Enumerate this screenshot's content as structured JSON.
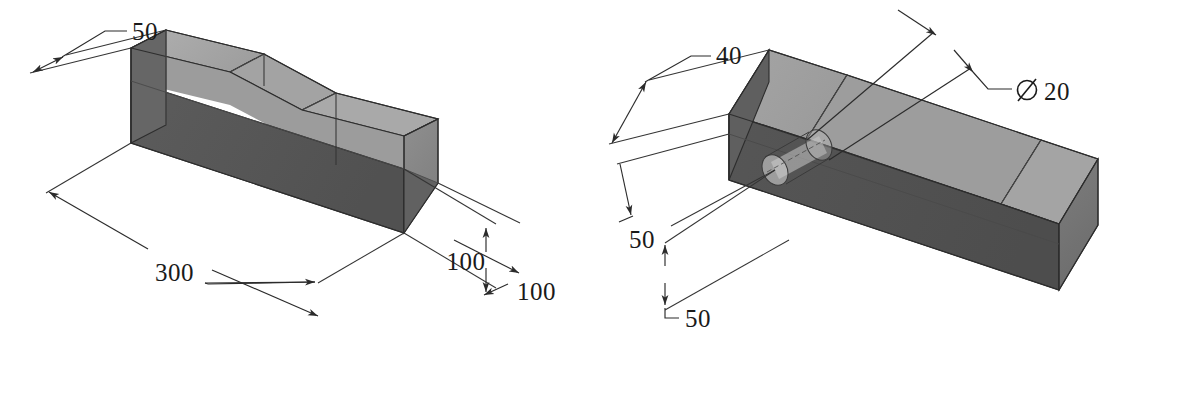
{
  "page": {
    "background_color": "#ffffff",
    "ink_color": "#2b2b2b",
    "figure_count": 2
  },
  "palette": {
    "face_top_light": "#a8a8a8",
    "face_front_dark": "#575757",
    "face_side_dark": "#6b6b6b",
    "face_end_mid": "#8d8d8d",
    "face_chamfer": "#9a9a9a",
    "hole_fill": "#d8d8d8",
    "line": "#2b2b2b"
  },
  "figures": [
    {
      "id": "left-block",
      "name": "isometric-block-without-hole",
      "description": "Isometric rectangular block with stepped chamfered top",
      "dimensions": [
        {
          "id": "width-50",
          "label": "50",
          "value": 50,
          "unit": "mm",
          "kind": "linear",
          "axis": "width"
        },
        {
          "id": "length-300",
          "label": "300",
          "value": 300,
          "unit": "mm",
          "kind": "linear",
          "axis": "length"
        },
        {
          "id": "height-100",
          "label": "100",
          "value": 100,
          "unit": "mm",
          "kind": "linear",
          "axis": "height"
        },
        {
          "id": "depth-100",
          "label": "100",
          "value": 100,
          "unit": "mm",
          "kind": "linear",
          "axis": "depth"
        }
      ]
    },
    {
      "id": "right-block",
      "name": "isometric-block-with-through-hole",
      "description": "Isometric rectangular block with chamfer and a cylindrical through hole",
      "dimensions": [
        {
          "id": "width-40",
          "label": "40",
          "value": 40,
          "unit": "mm",
          "kind": "linear",
          "axis": "width"
        },
        {
          "id": "offset-50-a",
          "label": "50",
          "value": 50,
          "unit": "mm",
          "kind": "linear",
          "axis": "offset"
        },
        {
          "id": "offset-50-b",
          "label": "50",
          "value": 50,
          "unit": "mm",
          "kind": "linear",
          "axis": "offset"
        },
        {
          "id": "hole-dia-20",
          "label": "20",
          "value": 20,
          "unit": "mm",
          "kind": "diameter",
          "symbol": "⌀",
          "full_label": "⌀ 20"
        }
      ]
    }
  ],
  "labels": {
    "l_50": "50",
    "l_300": "300",
    "l_100_vertical": "100",
    "l_100_diagonal": "100",
    "r_40": "40",
    "r_50_upper": "50",
    "r_50_lower": "50",
    "r_dia_symbol": "⌀",
    "r_dia_value": "20"
  }
}
